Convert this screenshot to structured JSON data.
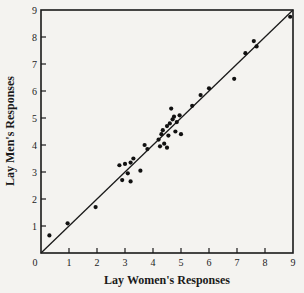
{
  "chart_data": {
    "type": "scatter",
    "title": "",
    "xlabel": "Lay Women's Responses",
    "ylabel": "Lay Men's Responses",
    "xlim": [
      0,
      9
    ],
    "ylim": [
      0,
      9
    ],
    "x_ticks": [
      "0",
      "1",
      "2",
      "3",
      "4",
      "5",
      "6",
      "7",
      "8",
      "9"
    ],
    "y_ticks": [
      "1",
      "2",
      "3",
      "4",
      "5",
      "6",
      "7",
      "8",
      "9"
    ],
    "grid": false,
    "legend": null,
    "reference_line": {
      "from": [
        0,
        0
      ],
      "to": [
        9,
        9
      ],
      "label": "y = x"
    },
    "series": [
      {
        "name": "Responses",
        "points": [
          [
            0.3,
            0.65
          ],
          [
            0.95,
            1.1
          ],
          [
            1.95,
            1.7
          ],
          [
            2.8,
            3.25
          ],
          [
            2.9,
            2.7
          ],
          [
            3.0,
            3.3
          ],
          [
            3.1,
            2.95
          ],
          [
            3.2,
            2.65
          ],
          [
            3.3,
            3.5
          ],
          [
            3.55,
            3.05
          ],
          [
            3.2,
            3.35
          ],
          [
            3.7,
            4.0
          ],
          [
            3.8,
            3.85
          ],
          [
            4.2,
            4.2
          ],
          [
            4.25,
            3.95
          ],
          [
            4.3,
            4.4
          ],
          [
            4.4,
            4.05
          ],
          [
            4.5,
            3.9
          ],
          [
            4.35,
            4.55
          ],
          [
            4.5,
            4.7
          ],
          [
            4.6,
            4.8
          ],
          [
            4.65,
            5.35
          ],
          [
            4.7,
            4.95
          ],
          [
            4.75,
            5.05
          ],
          [
            4.8,
            4.5
          ],
          [
            4.85,
            4.85
          ],
          [
            4.95,
            5.1
          ],
          [
            5.0,
            4.4
          ],
          [
            4.55,
            4.35
          ],
          [
            5.4,
            5.45
          ],
          [
            5.7,
            5.85
          ],
          [
            6.0,
            6.1
          ],
          [
            6.9,
            6.45
          ],
          [
            7.3,
            7.4
          ],
          [
            7.6,
            7.85
          ],
          [
            7.7,
            7.65
          ],
          [
            8.9,
            8.75
          ]
        ]
      }
    ]
  }
}
